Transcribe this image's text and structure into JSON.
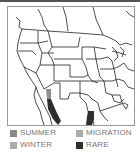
{
  "map": {
    "title": "Range map",
    "region": "North America (western US / northern Mexico)"
  },
  "legend": {
    "items": [
      {
        "label": "SUMMER",
        "color": "#8a8a8a"
      },
      {
        "label": "MIGRATION",
        "color": "#aaaaaa"
      },
      {
        "label": "WINTER",
        "color": "#aaaaaa"
      },
      {
        "label": "RARE",
        "color": "#2e2e2e"
      }
    ]
  },
  "colors": {
    "border": "#999999",
    "lines": "#222222",
    "migration": "#8f8f8f",
    "rare": "#2e2e2e"
  }
}
